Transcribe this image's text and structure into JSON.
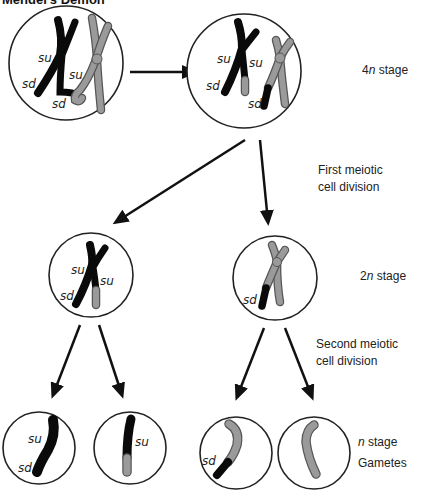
{
  "title": "Mendel's Demon",
  "labels": {
    "stage_4n_num": "4",
    "stage_4n_var": "n",
    "stage_4n_rest": " stage",
    "first_div_line1": "First meiotic",
    "first_div_line2": "cell division",
    "stage_2n_num": "2",
    "stage_2n_var": "n",
    "stage_2n_rest": " stage",
    "second_div_line1": "Second meiotic",
    "second_div_line2": "cell division",
    "stage_n_var": "n",
    "stage_n_rest": " stage",
    "gametes": "Gametes"
  },
  "gene_labels": {
    "su": "su",
    "sd": "sd"
  },
  "colors": {
    "black_chromosome": "#0a0a0a",
    "gray_chromosome": "#9a9a9a",
    "outline": "#222222"
  }
}
